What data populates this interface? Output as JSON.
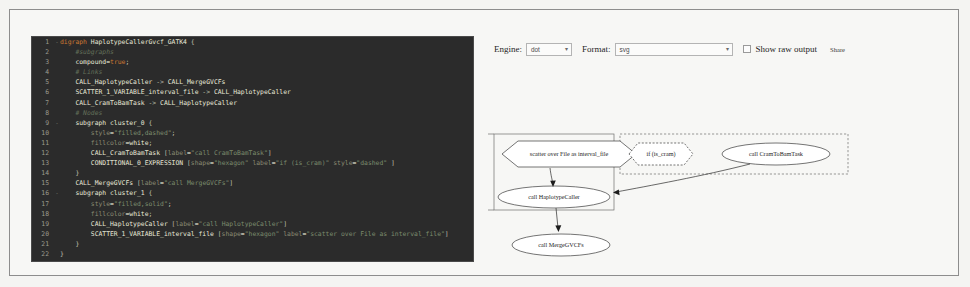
{
  "editor": {
    "lines": [
      {
        "n": "1",
        "fold": "-",
        "tokens": [
          {
            "t": "kw",
            "v": "digraph "
          },
          {
            "t": "id",
            "v": "HaplotypeCallerGvcf_GATK4"
          },
          {
            "t": "punc",
            "v": " {"
          }
        ]
      },
      {
        "n": "2",
        "fold": "",
        "tokens": [
          {
            "t": "cmt",
            "v": "    #subgraphs"
          }
        ]
      },
      {
        "n": "3",
        "fold": "",
        "tokens": [
          {
            "t": "id",
            "v": "    compound"
          },
          {
            "t": "punc",
            "v": "="
          },
          {
            "t": "kw",
            "v": "true"
          },
          {
            "t": "punc",
            "v": ";"
          }
        ]
      },
      {
        "n": "4",
        "fold": "",
        "tokens": [
          {
            "t": "cmt",
            "v": "    # Links"
          }
        ]
      },
      {
        "n": "5",
        "fold": "",
        "tokens": [
          {
            "t": "id",
            "v": "    CALL_HaplotypeCaller"
          },
          {
            "t": "punc",
            "v": " -> "
          },
          {
            "t": "id",
            "v": "CALL_MergeGVCFs"
          }
        ]
      },
      {
        "n": "6",
        "fold": "",
        "tokens": [
          {
            "t": "id",
            "v": "    SCATTER_1_VARIABLE_interval_file"
          },
          {
            "t": "punc",
            "v": " -> "
          },
          {
            "t": "id",
            "v": "CALL_HaplotypeCaller"
          }
        ]
      },
      {
        "n": "7",
        "fold": "",
        "tokens": [
          {
            "t": "id",
            "v": "    CALL_CramToBamTask"
          },
          {
            "t": "punc",
            "v": " -> "
          },
          {
            "t": "id",
            "v": "CALL_HaplotypeCaller"
          }
        ]
      },
      {
        "n": "8",
        "fold": "",
        "tokens": [
          {
            "t": "cmt",
            "v": "    # Nodes"
          }
        ]
      },
      {
        "n": "9",
        "fold": "-",
        "tokens": [
          {
            "t": "id",
            "v": "    subgraph cluster_0"
          },
          {
            "t": "punc",
            "v": " {"
          }
        ]
      },
      {
        "n": "10",
        "fold": "",
        "tokens": [
          {
            "t": "attr",
            "v": "        style"
          },
          {
            "t": "punc",
            "v": "="
          },
          {
            "t": "str",
            "v": "\"filled,dashed\""
          },
          {
            "t": "punc",
            "v": ";"
          }
        ]
      },
      {
        "n": "11",
        "fold": "",
        "tokens": [
          {
            "t": "attr",
            "v": "        fillcolor"
          },
          {
            "t": "punc",
            "v": "="
          },
          {
            "t": "id",
            "v": "white"
          },
          {
            "t": "punc",
            "v": ";"
          }
        ]
      },
      {
        "n": "12",
        "fold": "",
        "tokens": [
          {
            "t": "id",
            "v": "        CALL_CramToBamTask"
          },
          {
            "t": "punc",
            "v": " ["
          },
          {
            "t": "attr",
            "v": "label"
          },
          {
            "t": "punc",
            "v": "="
          },
          {
            "t": "str",
            "v": "\"call CramToBamTask\""
          },
          {
            "t": "punc",
            "v": "]"
          }
        ]
      },
      {
        "n": "13",
        "fold": "",
        "tokens": [
          {
            "t": "id",
            "v": "        CONDITIONAL_0_EXPRESSION"
          },
          {
            "t": "punc",
            "v": " ["
          },
          {
            "t": "attr",
            "v": "shape"
          },
          {
            "t": "punc",
            "v": "="
          },
          {
            "t": "str",
            "v": "\"hexagon\""
          },
          {
            "t": "attr",
            "v": " label"
          },
          {
            "t": "punc",
            "v": "="
          },
          {
            "t": "str",
            "v": "\"if (is_cram)\""
          },
          {
            "t": "attr",
            "v": " style"
          },
          {
            "t": "punc",
            "v": "="
          },
          {
            "t": "str",
            "v": "\"dashed\""
          },
          {
            "t": "punc",
            "v": " ]"
          }
        ]
      },
      {
        "n": "14",
        "fold": "",
        "tokens": [
          {
            "t": "punc",
            "v": "    }"
          }
        ]
      },
      {
        "n": "15",
        "fold": "",
        "tokens": [
          {
            "t": "id",
            "v": "    CALL_MergeGVCFs"
          },
          {
            "t": "punc",
            "v": " ["
          },
          {
            "t": "attr",
            "v": "label"
          },
          {
            "t": "punc",
            "v": "="
          },
          {
            "t": "str",
            "v": "\"call MergeGVCFs\""
          },
          {
            "t": "punc",
            "v": "]"
          }
        ]
      },
      {
        "n": "16",
        "fold": "-",
        "tokens": [
          {
            "t": "id",
            "v": "    subgraph cluster_1"
          },
          {
            "t": "punc",
            "v": " {"
          }
        ]
      },
      {
        "n": "17",
        "fold": "",
        "tokens": [
          {
            "t": "attr",
            "v": "        style"
          },
          {
            "t": "punc",
            "v": "="
          },
          {
            "t": "str",
            "v": "\"filled,solid\""
          },
          {
            "t": "punc",
            "v": ";"
          }
        ]
      },
      {
        "n": "18",
        "fold": "",
        "tokens": [
          {
            "t": "attr",
            "v": "        fillcolor"
          },
          {
            "t": "punc",
            "v": "="
          },
          {
            "t": "id",
            "v": "white"
          },
          {
            "t": "punc",
            "v": ";"
          }
        ]
      },
      {
        "n": "19",
        "fold": "",
        "tokens": [
          {
            "t": "id",
            "v": "        CALL_HaplotypeCaller"
          },
          {
            "t": "punc",
            "v": " ["
          },
          {
            "t": "attr",
            "v": "label"
          },
          {
            "t": "punc",
            "v": "="
          },
          {
            "t": "str",
            "v": "\"call HaplotypeCaller\""
          },
          {
            "t": "punc",
            "v": "]"
          }
        ]
      },
      {
        "n": "20",
        "fold": "",
        "tokens": [
          {
            "t": "id",
            "v": "        SCATTER_1_VARIABLE_interval_file"
          },
          {
            "t": "punc",
            "v": " ["
          },
          {
            "t": "attr",
            "v": "shape"
          },
          {
            "t": "punc",
            "v": "="
          },
          {
            "t": "str",
            "v": "\"hexagon\""
          },
          {
            "t": "attr",
            "v": " label"
          },
          {
            "t": "punc",
            "v": "="
          },
          {
            "t": "str",
            "v": "\"scatter over File as interval_file\""
          },
          {
            "t": "punc",
            "v": "]"
          }
        ]
      },
      {
        "n": "21",
        "fold": "",
        "tokens": [
          {
            "t": "punc",
            "v": "    }"
          }
        ]
      },
      {
        "n": "22",
        "fold": "",
        "tokens": [
          {
            "t": "punc",
            "v": "}"
          }
        ]
      }
    ]
  },
  "toolbar": {
    "engine_label": "Engine:",
    "engine_value": "dot",
    "format_label": "Format:",
    "format_value": "svg",
    "show_raw_output_label": "Show raw output",
    "share_label": "Share",
    "caret": "▾"
  },
  "graph": {
    "nodes": [
      {
        "id": "scatter",
        "label": "scatter over File as interval_file",
        "shape": "hexagon",
        "style": "solid"
      },
      {
        "id": "conditional",
        "label": "if (is_cram)",
        "shape": "hexagon",
        "style": "dashed"
      },
      {
        "id": "cramtobam",
        "label": "call CramToBamTask",
        "shape": "ellipse",
        "style": "solid"
      },
      {
        "id": "haplotype",
        "label": "call HaplotypeCaller",
        "shape": "ellipse",
        "style": "solid"
      },
      {
        "id": "mergegvcfs",
        "label": "call MergeGVCFs",
        "shape": "ellipse",
        "style": "solid"
      }
    ],
    "clusters": [
      {
        "id": "cluster_1",
        "style": "solid"
      },
      {
        "id": "cluster_0",
        "style": "dashed"
      }
    ],
    "edges": [
      {
        "from": "scatter",
        "to": "haplotype"
      },
      {
        "from": "cramtobam",
        "to": "haplotype"
      },
      {
        "from": "haplotype",
        "to": "mergegvcfs"
      }
    ]
  }
}
